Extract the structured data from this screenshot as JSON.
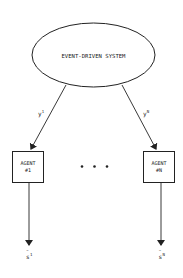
{
  "diagram": {
    "system": {
      "label": "EVENT-DRIVEN SYSTEM"
    },
    "edges_in": [
      {
        "var": "y",
        "sup": "1"
      },
      {
        "var": "y",
        "sup": "N"
      }
    ],
    "agents": [
      {
        "line1": "AGENT",
        "line2": "#1"
      },
      {
        "line1": "AGENT",
        "line2": "#N"
      }
    ],
    "ellipsis": "• • •",
    "outputs": [
      {
        "var": "s",
        "accent": "~",
        "sup": "1"
      },
      {
        "var": "s",
        "accent": "~",
        "sup": "N"
      }
    ],
    "colors": {
      "stroke": "#222222",
      "background": "#ffffff"
    }
  }
}
